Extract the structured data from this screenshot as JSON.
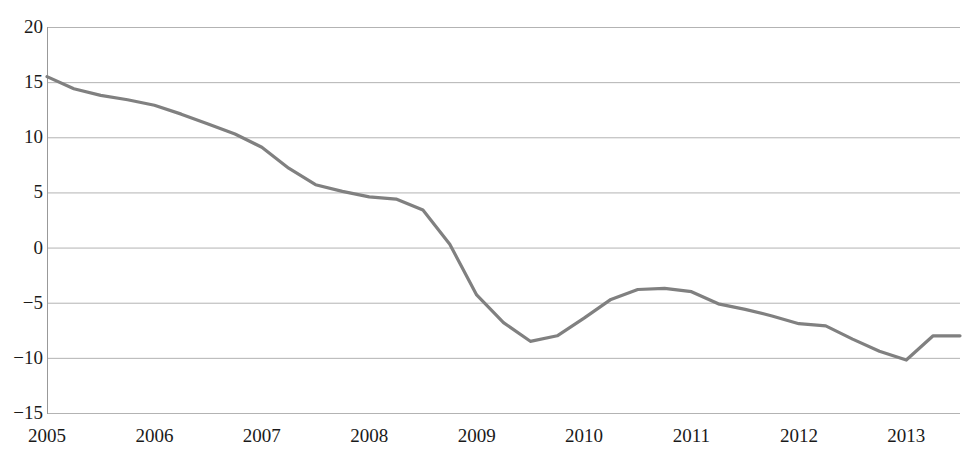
{
  "chart_data": {
    "type": "line",
    "title": "",
    "subtitle": "",
    "xlabel": "",
    "ylabel": "",
    "grid": true,
    "legend": false,
    "legend_position": "none",
    "line_color": "#808080",
    "grid_color": "#b3b3b3",
    "axis_color": "#999999",
    "text_color": "#1a1a1a",
    "background": "#ffffff",
    "ylim": [
      -15,
      20
    ],
    "xlim": [
      2005.0,
      2013.5
    ],
    "yticks": [
      20,
      15,
      10,
      5,
      0,
      -5,
      -10,
      -15
    ],
    "ytick_labels": [
      "20",
      "15",
      "10",
      "5",
      "0",
      "−5",
      "−10",
      "−15"
    ],
    "xticks": [
      2005,
      2006,
      2007,
      2008,
      2009,
      2010,
      2011,
      2012,
      2013
    ],
    "xtick_labels": [
      "2005",
      "2006",
      "2007",
      "2008",
      "2009",
      "2010",
      "2011",
      "2012",
      "2013"
    ],
    "series": [
      {
        "name": "series-1",
        "color": "#808080",
        "x": [
          2005.0,
          2005.25,
          2005.5,
          2005.75,
          2006.0,
          2006.25,
          2006.5,
          2006.75,
          2007.0,
          2007.25,
          2007.5,
          2007.75,
          2008.0,
          2008.25,
          2008.5,
          2008.75,
          2009.0,
          2009.25,
          2009.5,
          2009.75,
          2010.0,
          2010.25,
          2010.5,
          2010.75,
          2011.0,
          2011.25,
          2011.5,
          2011.75,
          2012.0,
          2012.25,
          2012.5,
          2012.75,
          2013.0,
          2013.25,
          2013.5
        ],
        "y": [
          15.5,
          14.4,
          13.8,
          13.4,
          12.9,
          12.1,
          11.2,
          10.3,
          9.1,
          7.2,
          5.7,
          5.1,
          4.6,
          4.4,
          3.4,
          0.3,
          -4.3,
          -6.8,
          -8.5,
          -8.0,
          -6.4,
          -4.7,
          -3.8,
          -3.7,
          -4.0,
          -5.1,
          -5.6,
          -6.2,
          -6.9,
          -7.1,
          -8.3,
          -9.4,
          -10.2,
          -8.0,
          -8.0
        ]
      }
    ]
  },
  "geometry": {
    "plot_left": 47,
    "plot_right": 960,
    "plot_top": 27,
    "plot_bottom": 413
  }
}
